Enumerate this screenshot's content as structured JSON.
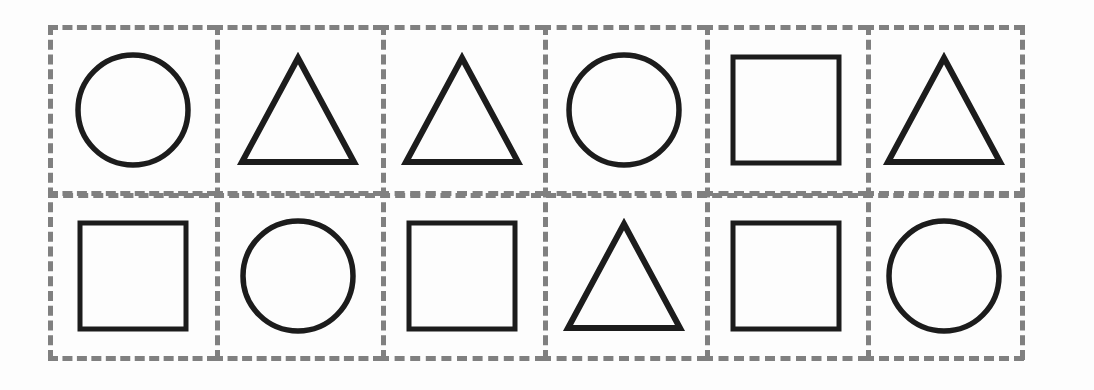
{
  "page": {
    "background_color": "#fdfdfd",
    "dash_color": "#808080",
    "ink_color": "#1c1c1c",
    "columns": 6,
    "rows": 2
  },
  "legend": {
    "circle_label": "circle",
    "triangle_label": "triangle",
    "square_label": "square"
  },
  "grid": {
    "cells": [
      {
        "row": 1,
        "col": 1,
        "shape": "circle"
      },
      {
        "row": 1,
        "col": 2,
        "shape": "triangle"
      },
      {
        "row": 1,
        "col": 3,
        "shape": "triangle"
      },
      {
        "row": 1,
        "col": 4,
        "shape": "circle"
      },
      {
        "row": 1,
        "col": 5,
        "shape": "square"
      },
      {
        "row": 1,
        "col": 6,
        "shape": "triangle"
      },
      {
        "row": 2,
        "col": 1,
        "shape": "square"
      },
      {
        "row": 2,
        "col": 2,
        "shape": "circle"
      },
      {
        "row": 2,
        "col": 3,
        "shape": "square"
      },
      {
        "row": 2,
        "col": 4,
        "shape": "triangle"
      },
      {
        "row": 2,
        "col": 5,
        "shape": "square"
      },
      {
        "row": 2,
        "col": 6,
        "shape": "circle"
      }
    ],
    "shape_sizes": {
      "circle": {
        "width": 118,
        "height": 118
      },
      "triangle": {
        "width": 124,
        "height": 116
      },
      "square": {
        "width": 116,
        "height": 116
      }
    }
  }
}
